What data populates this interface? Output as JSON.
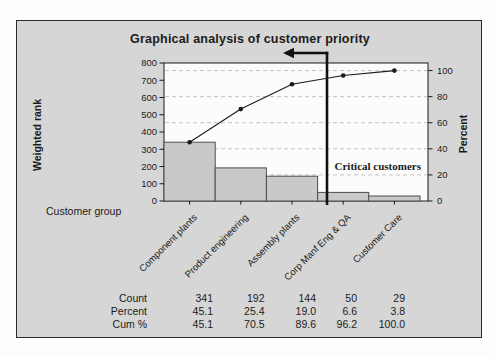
{
  "chart_data": {
    "type": "bar",
    "subtype": "pareto",
    "title": "Graphical analysis of customer priority",
    "categories": [
      "Component plants",
      "Product engineering",
      "Assembly plants",
      "Corp Manf Eng & QA",
      "Customer Care"
    ],
    "series": [
      {
        "name": "Count",
        "type": "bar",
        "axis": "left",
        "values": [
          341,
          192,
          144,
          50,
          29
        ]
      },
      {
        "name": "Cum %",
        "type": "line",
        "axis": "right",
        "values": [
          45.1,
          70.5,
          89.6,
          96.2,
          100.0
        ]
      }
    ],
    "total_count": 756,
    "xlabel": "Customer group",
    "ylabel_left": "Weighted rank",
    "ylabel_right": "Percent",
    "ylim_left": [
      0,
      800
    ],
    "yticks_left": [
      0,
      100,
      200,
      300,
      400,
      500,
      600,
      700,
      800
    ],
    "ylim_right": [
      0,
      100
    ],
    "yticks_right": [
      0,
      20,
      40,
      60,
      80,
      100
    ],
    "grid": "dashed horizontal lines at right-axis ticks",
    "legend": "none",
    "annotation": {
      "text": "Critical customers",
      "meaning": "cutoff line with left-pointing arrow after Assembly plants"
    },
    "table": {
      "row_labels": [
        "Count",
        "Percent",
        "Cum %"
      ],
      "rows": [
        [
          "341",
          "192",
          "144",
          "50",
          "29"
        ],
        [
          "45.1",
          "25.4",
          "19.0",
          "6.6",
          "3.8"
        ],
        [
          "45.1",
          "70.5",
          "89.6",
          "96.2",
          "100.0"
        ]
      ]
    }
  },
  "colors": {
    "panel_bg": "#d6d6d6",
    "plot_bg": "#fcfcfc",
    "bar_fill": "#c9c9c9",
    "bar_border": "#4d4d4d",
    "grid_line": "#c2c2c2",
    "axis_line": "#1a1a1a",
    "cutoff_line": "#111111",
    "text": "#1b1b1b"
  }
}
